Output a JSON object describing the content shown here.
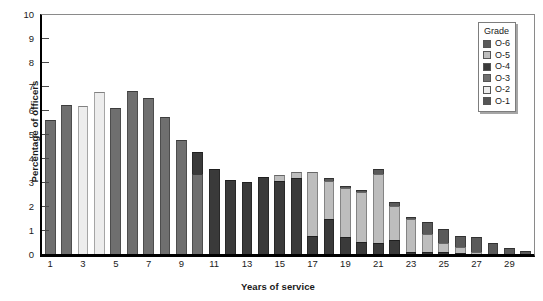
{
  "chart_data": {
    "type": "bar",
    "subtype": "stacked",
    "title": "",
    "xlabel": "Years of service",
    "ylabel": "Percentage of officers",
    "ylim": [
      0,
      10
    ],
    "ytick_labels": [
      "0",
      "1",
      "2",
      "3",
      "4",
      "5",
      "6",
      "7",
      "8",
      "9",
      "10"
    ],
    "xtick_labels": [
      "1",
      "3",
      "5",
      "7",
      "9",
      "11",
      "13",
      "15",
      "17",
      "19",
      "21",
      "23",
      "25",
      "27",
      "29"
    ],
    "categories": [
      1,
      2,
      3,
      4,
      5,
      6,
      7,
      8,
      9,
      10,
      11,
      12,
      13,
      14,
      15,
      16,
      17,
      18,
      19,
      20,
      21,
      22,
      23,
      24,
      25,
      26,
      27,
      28,
      29,
      30
    ],
    "grid": false,
    "legend_position": "top-right",
    "legend_title": "Grade",
    "series": [
      {
        "name": "O-1",
        "color": "#6f6f6f",
        "values": [
          5.6,
          6.2,
          0,
          0,
          0,
          0,
          0,
          0,
          0,
          0,
          0,
          0,
          0,
          0,
          0,
          0,
          0,
          0,
          0,
          0,
          0,
          0,
          0,
          0,
          0,
          0,
          0,
          0,
          0,
          0
        ]
      },
      {
        "name": "O-2",
        "color": "#ededed",
        "values": [
          0,
          0,
          6.15,
          6.75,
          0,
          0,
          0,
          0,
          0,
          0,
          0,
          0,
          0,
          0,
          0,
          0,
          0,
          0,
          0,
          0,
          0,
          0,
          0,
          0,
          0,
          0,
          0,
          0,
          0,
          0
        ]
      },
      {
        "name": "O-3",
        "color": "#6f6f6f",
        "values": [
          0,
          0,
          0,
          0,
          6.1,
          6.8,
          6.5,
          5.7,
          4.75,
          3.35,
          0,
          0,
          0,
          0,
          0,
          0,
          0,
          0,
          0,
          0,
          0,
          0,
          0,
          0,
          0,
          0,
          0,
          0,
          0,
          0
        ]
      },
      {
        "name": "O-4",
        "color": "#3a3a3a",
        "values": [
          0,
          0,
          0,
          0,
          0,
          0,
          0,
          0,
          0,
          0.9,
          3.55,
          3.1,
          3.0,
          3.2,
          3.05,
          3.15,
          0.75,
          1.45,
          0.7,
          0.5,
          0.45,
          0.6,
          0.1,
          0.1,
          0.1,
          0.05,
          0,
          0,
          0,
          0
        ]
      },
      {
        "name": "O-5",
        "color": "#bdbdbd",
        "values": [
          0,
          0,
          0,
          0,
          0,
          0,
          0,
          0,
          0,
          0,
          0,
          0,
          0,
          0,
          0.25,
          0.25,
          2.65,
          1.6,
          2.05,
          2.1,
          2.9,
          1.4,
          1.35,
          0.75,
          0.35,
          0.25,
          0.1,
          0,
          0,
          0
        ]
      },
      {
        "name": "O-6",
        "color": "#5a5a5a",
        "values": [
          0,
          0,
          0,
          0,
          0,
          0,
          0,
          0,
          0,
          0,
          0,
          0,
          0,
          0,
          0,
          0,
          0,
          0.1,
          0.1,
          0.05,
          0.2,
          0.15,
          0.1,
          0.5,
          0.6,
          0.45,
          0.6,
          0.45,
          0.25,
          0.12
        ]
      }
    ],
    "totals": [
      5.6,
      6.2,
      6.15,
      6.75,
      6.1,
      6.8,
      6.5,
      5.7,
      4.75,
      4.25,
      3.55,
      3.1,
      3.0,
      3.2,
      3.3,
      3.4,
      3.4,
      3.15,
      2.85,
      2.65,
      3.55,
      2.15,
      1.55,
      1.35,
      1.05,
      0.75,
      0.7,
      0.45,
      0.25,
      0.12
    ]
  },
  "legend": {
    "title": "Grade",
    "items": [
      {
        "label": "O-6",
        "color": "#5a5a5a"
      },
      {
        "label": "O-5",
        "color": "#bdbdbd"
      },
      {
        "label": "O-4",
        "color": "#3a3a3a"
      },
      {
        "label": "O-3",
        "color": "#6f6f6f"
      },
      {
        "label": "O-2",
        "color": "#ededed"
      },
      {
        "label": "O-1",
        "color": "#555555"
      }
    ]
  },
  "axes": {
    "y_title": "Percentage of officers",
    "x_title": "Years of service"
  },
  "colors": {
    "axis": "#000000",
    "frame": "#8a8a8a",
    "text": "#1a1a1a",
    "background": "#ffffff"
  }
}
